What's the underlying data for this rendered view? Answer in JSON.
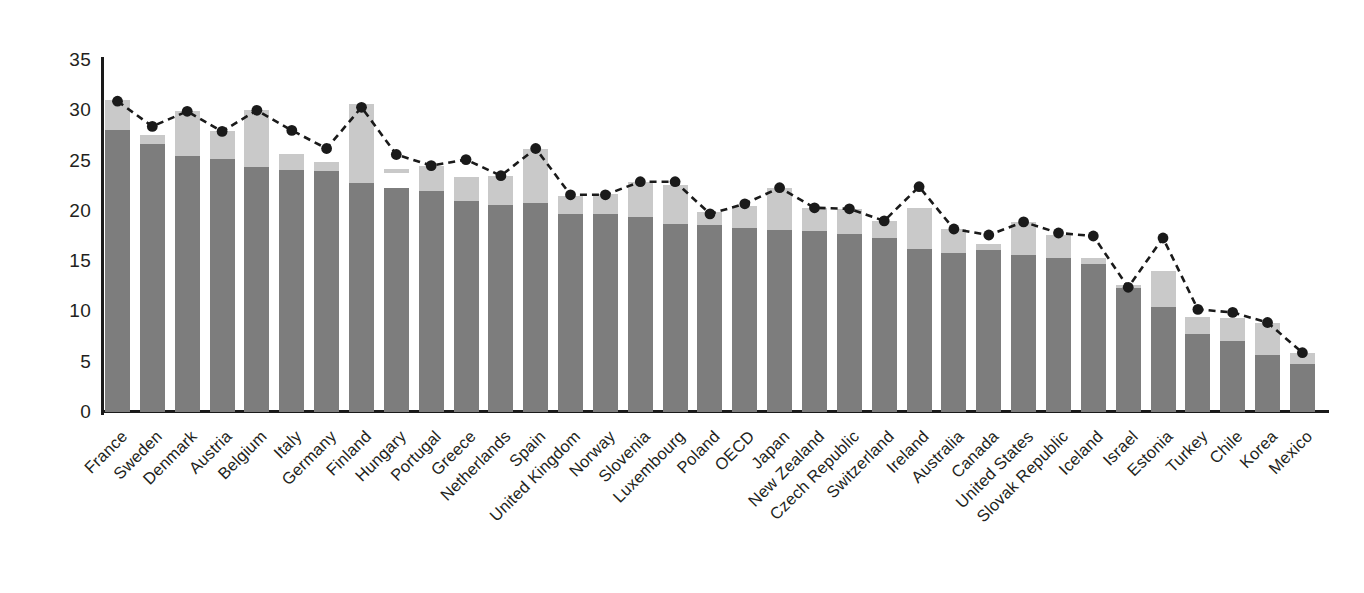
{
  "chart_data": {
    "type": "bar",
    "title": "",
    "subtitle": "",
    "xlabel": "",
    "ylabel": "",
    "ylim": [
      0,
      35
    ],
    "yticks": [
      0,
      5,
      10,
      15,
      20,
      25,
      30,
      35
    ],
    "ytick_labels": [
      "0",
      "5",
      "10",
      "15",
      "20",
      "25",
      "30",
      "35"
    ],
    "grid": false,
    "legend": "none",
    "stacked": true,
    "categories": [
      "France",
      "Sweden",
      "Denmark",
      "Austria",
      "Belgium",
      "Italy",
      "Germany",
      "Finland",
      "Hungary",
      "Portugal",
      "Greece",
      "Netherlands",
      "Spain",
      "United Kingdom",
      "Norway",
      "Slovenia",
      "Luxembourg",
      "Poland",
      "OECD",
      "Japan",
      "New Zealand",
      "Czech Republic",
      "Switzerland",
      "Ireland",
      "Australia",
      "Canada",
      "United States",
      "Slovak Republic",
      "Iceland",
      "Israel",
      "Estonia",
      "Turkey",
      "Chile",
      "Korea",
      "Mexico"
    ],
    "series": [
      {
        "name": "lower-segment",
        "color": "#7d7d7d",
        "values": [
          28.0,
          26.6,
          25.5,
          25.2,
          24.4,
          24.1,
          24.0,
          22.8,
          22.3,
          22.0,
          21.0,
          20.6,
          20.8,
          19.7,
          19.7,
          19.4,
          18.7,
          18.6,
          18.3,
          18.1,
          18.0,
          17.7,
          17.3,
          16.2,
          15.8,
          16.1,
          15.6,
          15.3,
          14.7,
          12.3,
          10.4,
          7.8,
          7.1,
          5.7,
          4.8
        ]
      },
      {
        "name": "upper-segment",
        "color": "#c9c9c9",
        "values": [
          3.0,
          0.9,
          4.4,
          2.7,
          5.6,
          1.6,
          0.9,
          7.8,
          1.7,
          2.5,
          2.4,
          2.9,
          5.4,
          1.8,
          2.0,
          3.5,
          3.9,
          1.3,
          2.2,
          4.2,
          2.3,
          2.5,
          1.7,
          4.1,
          2.4,
          0.6,
          3.3,
          2.3,
          0.6,
          0.3,
          3.6,
          1.6,
          2.2,
          3.2,
          1.1
        ]
      }
    ],
    "totals": [
      31.0,
      27.5,
      29.9,
      27.9,
      30.0,
      25.7,
      24.9,
      30.6,
      24.0,
      24.5,
      23.4,
      23.5,
      26.2,
      21.5,
      21.7,
      22.9,
      22.6,
      19.9,
      20.5,
      22.3,
      20.3,
      20.2,
      19.0,
      20.3,
      18.2,
      16.7,
      18.9,
      17.6,
      15.3,
      12.6,
      14.0,
      9.4,
      9.3,
      8.9,
      5.9
    ],
    "marker_series": {
      "name": "dashed-line-with-markers",
      "color": "#1a1a1a",
      "style": "dashed",
      "marker": "circle",
      "values": [
        30.9,
        28.4,
        29.9,
        27.9,
        30.0,
        28.0,
        26.2,
        30.3,
        25.6,
        24.5,
        25.1,
        23.5,
        26.2,
        21.6,
        21.6,
        22.9,
        22.9,
        19.7,
        20.7,
        22.3,
        20.3,
        20.2,
        19.0,
        22.4,
        18.2,
        17.6,
        18.9,
        17.8,
        17.5,
        12.4,
        17.3,
        10.2,
        9.9,
        8.9,
        5.9
      ]
    },
    "hungary_floating_segment": {
      "note": "Hungary's light segment is detached from its dark bar",
      "from": 23.8,
      "to": 24.2
    }
  },
  "axis": {
    "y_axis_name": "value-axis",
    "x_axis_name": "country-axis"
  }
}
